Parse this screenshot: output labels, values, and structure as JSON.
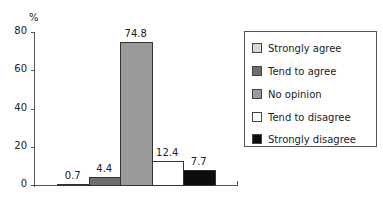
{
  "chart_data": {
    "type": "bar",
    "title": "",
    "xlabel": "",
    "ylabel": "%",
    "ylim": [
      0,
      80
    ],
    "yticks": [
      0,
      20,
      40,
      60,
      80
    ],
    "grid": false,
    "legend_position": "right",
    "categories": [
      "Strongly agree",
      "Tend to agree",
      "No opinion",
      "Tend to disagree",
      "Strongly disagree"
    ],
    "values": [
      0.7,
      4.4,
      74.8,
      12.4,
      7.7
    ],
    "value_labels": [
      "0.7",
      "4.4",
      "74.8",
      "12.4",
      "7.7"
    ],
    "colors": [
      "#d9d9d9",
      "#6e6e6e",
      "#9a9a9a",
      "#ffffff",
      "#0d0d0d"
    ]
  },
  "axis": {
    "y_unit": "%",
    "tick_labels": [
      "0",
      "20",
      "40",
      "60",
      "80"
    ]
  },
  "legend": {
    "items": [
      {
        "label": "Strongly agree",
        "color": "#d9d9d9"
      },
      {
        "label": "Tend to agree",
        "color": "#6e6e6e"
      },
      {
        "label": "No opinion",
        "color": "#9a9a9a"
      },
      {
        "label": "Tend to disagree",
        "color": "#ffffff"
      },
      {
        "label": "Strongly disagree",
        "color": "#0d0d0d"
      }
    ]
  }
}
